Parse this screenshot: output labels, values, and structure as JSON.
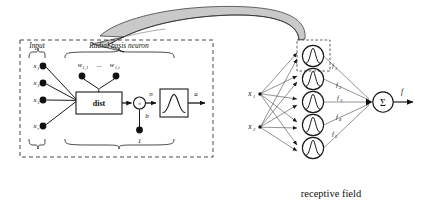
{
  "figure": {
    "title_caption": "receptive field",
    "detail_panel": {
      "section_labels": [
        "Input",
        "Radial basis neuron"
      ],
      "inputs": [
        "x",
        "x",
        "x",
        "x"
      ],
      "input_subs": [
        "1",
        "2",
        "3",
        "r"
      ],
      "weights": [
        "w",
        "w"
      ],
      "weight_subs": [
        "1,1",
        "1,r"
      ],
      "weight_ellipsis": "...",
      "dist_box_label": "dist",
      "product_symbol": "×",
      "net_input_label": "n",
      "bias_label": "b",
      "bias_constant": "1",
      "output_label": "a",
      "transfer_function": "gaussian-bell-curve"
    },
    "network": {
      "input_labels": [
        "x",
        "x"
      ],
      "input_subs": [
        "1",
        "2"
      ],
      "hidden_count": 5,
      "hidden_labels": [
        "f",
        "f",
        "f",
        "f",
        "f"
      ],
      "hidden_subs": [
        "1",
        "2",
        "3",
        "4",
        "5"
      ],
      "sum_symbol": "Σ",
      "output_label": "f",
      "highlight": "dashed-selection-box-on-first-neuron"
    },
    "colors": {
      "ink": "#111111",
      "line": "#1a1a1a",
      "thin_line": "#3a3a3a",
      "ribbon_fill": "#c9c9c9",
      "background": "#ffffff"
    },
    "icons": {
      "swoosh": "curved-ribbon-arrow-icon",
      "bell": "gaussian-curve-icon",
      "brace": "curly-brace-icon"
    }
  }
}
